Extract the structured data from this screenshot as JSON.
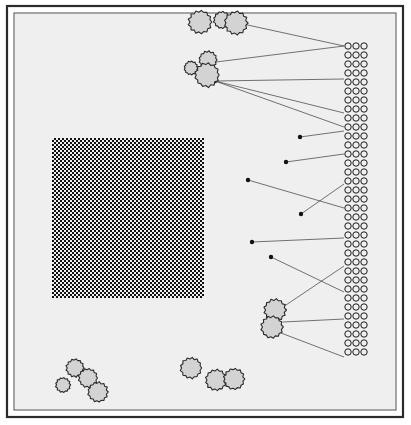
{
  "figure": {
    "title": "Schematic plan figure with stippled region, particle blobs and annotated circle column",
    "background_color": "#ffffff",
    "panel_fill": "#efefef",
    "panel_tone_note": "light warm gray scanned paper tone"
  },
  "frame": {
    "outer_border_color": "#2b2b2b",
    "outer_border_width": 2.2,
    "outer_rect": {
      "x": 7,
      "y": 6,
      "width": 396,
      "height": 411
    },
    "inner_border_color": "#4a4a4a",
    "inner_border_width": 1.0,
    "inner_rect": {
      "x": 14,
      "y": 13,
      "width": 382,
      "height": 397
    },
    "panel_rect": {
      "x": 15,
      "y": 14,
      "width": 380,
      "height": 395
    }
  },
  "stipple_region": {
    "name": "dotted-square",
    "x": 52,
    "y": 138,
    "width": 152,
    "height": 160,
    "dot_color": "#111111",
    "dot_size": 2.0,
    "pitch": 4.0,
    "pattern": "checkerboard-stipple"
  },
  "blob_style": {
    "fill": "#d3d3d3",
    "stroke": "#2a2a2a",
    "stroke_width": 1.1,
    "edge": "irregular-crenellated"
  },
  "blobs": [
    {
      "name": "blob-top-a",
      "cx": 200,
      "cy": 22,
      "r": 11,
      "group": "top-cluster"
    },
    {
      "name": "blob-top-b",
      "cx": 222,
      "cy": 20,
      "r": 8,
      "group": "top-cluster"
    },
    {
      "name": "blob-top-c",
      "cx": 236,
      "cy": 23,
      "r": 11,
      "group": "top-cluster"
    },
    {
      "name": "blob-upper-small",
      "cx": 191,
      "cy": 68,
      "r": 6.5,
      "group": "upper-cluster"
    },
    {
      "name": "blob-upper-a",
      "cx": 208,
      "cy": 60,
      "r": 8.5,
      "group": "upper-cluster"
    },
    {
      "name": "blob-upper-b",
      "cx": 207,
      "cy": 75,
      "r": 11.5,
      "group": "upper-cluster"
    },
    {
      "name": "blob-mid-right-top",
      "cx": 275,
      "cy": 310,
      "r": 10.5,
      "group": "mid-right-cluster"
    },
    {
      "name": "blob-mid-right-bottom",
      "cx": 272,
      "cy": 327,
      "r": 10.5,
      "group": "mid-right-cluster"
    },
    {
      "name": "blob-bl-a",
      "cx": 75,
      "cy": 368,
      "r": 8.5,
      "group": "bottom-left-cluster"
    },
    {
      "name": "blob-bl-b",
      "cx": 88,
      "cy": 378,
      "r": 9,
      "group": "bottom-left-cluster"
    },
    {
      "name": "blob-bl-c",
      "cx": 63,
      "cy": 385,
      "r": 7,
      "group": "bottom-left-cluster"
    },
    {
      "name": "blob-bl-d",
      "cx": 98,
      "cy": 392,
      "r": 9.5,
      "group": "bottom-left-cluster"
    },
    {
      "name": "blob-bc-a",
      "cx": 191,
      "cy": 368,
      "r": 10,
      "group": "bottom-center-cluster"
    },
    {
      "name": "blob-bc-b",
      "cx": 216,
      "cy": 380,
      "r": 10,
      "group": "bottom-center-cluster"
    },
    {
      "name": "blob-bc-c",
      "cx": 234,
      "cy": 379,
      "r": 10,
      "group": "bottom-center-cluster"
    }
  ],
  "circle_column": {
    "name": "paired-circle-column",
    "circles_per_row": 3,
    "row_count": 35,
    "first_row_cy": 46,
    "row_pitch": 9.0,
    "first_circle_cx": 348,
    "circle_pitch_x": 8.0,
    "radius": 3.2,
    "stroke": "#1a1a1a",
    "stroke_width": 1.0,
    "fill": "none"
  },
  "leader_lines": {
    "stroke": "#3a3a3a",
    "stroke_width": 0.7,
    "marker_radius": 2.2,
    "marker_fill": "#111111",
    "lines": [
      {
        "name": "leader-1",
        "x1": 243,
        "y1": 24,
        "x2": 344,
        "y2": 46,
        "marker": false
      },
      {
        "name": "leader-2",
        "x1": 216,
        "y1": 62,
        "x2": 344,
        "y2": 46,
        "marker": false
      },
      {
        "name": "leader-3",
        "x1": 215,
        "y1": 81,
        "x2": 344,
        "y2": 79,
        "marker": true
      },
      {
        "name": "leader-4",
        "x1": 215,
        "y1": 81,
        "x2": 344,
        "y2": 113,
        "marker": false
      },
      {
        "name": "leader-5",
        "x1": 215,
        "y1": 81,
        "x2": 344,
        "y2": 127,
        "marker": false
      },
      {
        "name": "leader-6",
        "x1": 300,
        "y1": 137,
        "x2": 344,
        "y2": 131,
        "marker": true
      },
      {
        "name": "leader-7",
        "x1": 286,
        "y1": 162,
        "x2": 344,
        "y2": 154,
        "marker": true
      },
      {
        "name": "leader-8",
        "x1": 248,
        "y1": 180,
        "x2": 344,
        "y2": 208,
        "marker": true
      },
      {
        "name": "leader-9",
        "x1": 301,
        "y1": 214,
        "x2": 344,
        "y2": 184,
        "marker": true
      },
      {
        "name": "leader-10",
        "x1": 252,
        "y1": 242,
        "x2": 344,
        "y2": 238,
        "marker": true
      },
      {
        "name": "leader-11",
        "x1": 271,
        "y1": 257,
        "x2": 344,
        "y2": 292,
        "marker": true
      },
      {
        "name": "leader-12",
        "x1": 283,
        "y1": 307,
        "x2": 344,
        "y2": 266,
        "marker": false
      },
      {
        "name": "leader-13",
        "x1": 283,
        "y1": 322,
        "x2": 344,
        "y2": 319,
        "marker": false
      },
      {
        "name": "leader-14",
        "x1": 281,
        "y1": 333,
        "x2": 344,
        "y2": 357,
        "marker": false
      }
    ]
  }
}
